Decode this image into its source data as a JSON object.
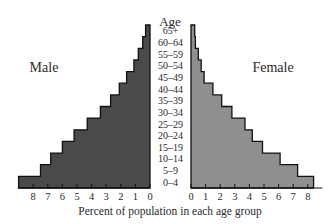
{
  "chart_data": {
    "type": "bar",
    "subtype": "population-pyramid",
    "title": "",
    "center_header": "Age",
    "xlabel": "Percent of population in each age group",
    "ylabel": "Age",
    "categories": [
      "0–4",
      "5–9",
      "10–14",
      "15–19",
      "20–24",
      "25–29",
      "30–34",
      "35–39",
      "40–44",
      "45–49",
      "50–54",
      "55–59",
      "60–64",
      "65+"
    ],
    "series": [
      {
        "name": "Male",
        "side": "left",
        "color": "#4a4a4a",
        "values": [
          9.0,
          7.5,
          6.8,
          6.0,
          5.2,
          4.3,
          3.4,
          2.7,
          2.1,
          1.6,
          1.1,
          0.8,
          0.5,
          0.3
        ]
      },
      {
        "name": "Female",
        "side": "right",
        "color": "#8f8f8f",
        "values": [
          8.4,
          7.3,
          6.1,
          4.9,
          4.2,
          3.7,
          2.8,
          2.1,
          1.5,
          0.9,
          0.7,
          0.5,
          0.3,
          0.25
        ]
      }
    ],
    "x_ticks_left": [
      "8",
      "7",
      "6",
      "5",
      "4",
      "3",
      "2",
      "1",
      "0"
    ],
    "x_ticks_right": [
      "0",
      "1",
      "2",
      "3",
      "4",
      "5",
      "6",
      "7",
      "8"
    ],
    "xlim": [
      0,
      9
    ],
    "grid": false,
    "legend": "side labels (Male left, Female right)"
  }
}
